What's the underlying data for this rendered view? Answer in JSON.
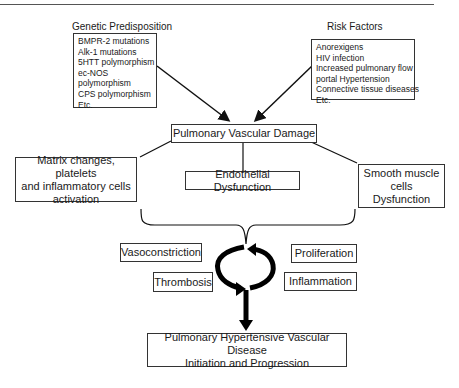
{
  "diagram": {
    "genetic": {
      "heading": "Genetic Predisposition",
      "items": [
        "BMPR-2 mutations",
        "Alk-1 mutations",
        "5HTT polymorphism",
        "ec-NOS",
        "polymorphism",
        "CPS polymorphism",
        "Etc."
      ]
    },
    "risk": {
      "heading": "Risk Factors",
      "items": [
        "Anorexigens",
        "HIV infection",
        "Increased pulmonary flow",
        "portal Hypertension",
        "Connective tissue diseases",
        "Etc."
      ]
    },
    "damage": "Pulmonary Vascular Damage",
    "matrix": [
      "Matrix changes, platelets",
      "and inflammatory cells",
      "activation"
    ],
    "endothelial": "Endothelial Dysfunction",
    "smooth": [
      "Smooth muscle",
      "cells",
      "Dysfunction"
    ],
    "cycle": {
      "vasoconstriction": "Vasoconstriction",
      "thrombosis": "Thrombosis",
      "proliferation": "Proliferation",
      "inflammation": "Inflammation"
    },
    "outcome": [
      "Pulmonary Hypertensive Vascular Disease",
      "Initiation and Progression"
    ]
  }
}
